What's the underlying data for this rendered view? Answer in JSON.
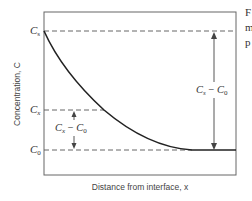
{
  "diagram": {
    "y_axis_label": "Concentration, C",
    "x_axis_label": "Distance from interface, x",
    "levels": [
      {
        "id": "Cs",
        "label": "C",
        "subscript": "s"
      },
      {
        "id": "Cx",
        "label": "C",
        "subscript": "x"
      },
      {
        "id": "C0",
        "label": "C",
        "subscript": "0"
      }
    ],
    "annotations": {
      "total_difference": {
        "text_a": "C",
        "sub_a": "s",
        "minus": " − ",
        "text_b": "C",
        "sub_b": "0"
      },
      "partial_difference": {
        "text_a": "C",
        "sub_a": "x",
        "minus": " − ",
        "text_b": "C",
        "sub_b": "0"
      }
    },
    "clipped_caption_fragments": [
      "F",
      "m",
      "p"
    ],
    "colors": {
      "curve": "#222222",
      "frame": "#555555",
      "dashed": "#555555",
      "arrow": "#444444"
    }
  }
}
